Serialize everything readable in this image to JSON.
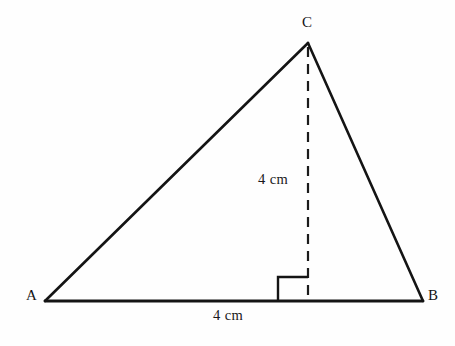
{
  "figure": {
    "kind": "geometry-triangle-with-altitude",
    "background_color": "#fefefe",
    "stroke_color": "#141414"
  },
  "vertices": {
    "a": {
      "label": "A",
      "x": 45,
      "y": 301
    },
    "b": {
      "label": "B",
      "x": 423,
      "y": 301
    },
    "c": {
      "label": "C",
      "x": 308,
      "y": 43
    }
  },
  "altitude": {
    "label": "4 cm",
    "style": "dashed",
    "from_x": 308,
    "from_y": 47,
    "to_x": 308,
    "to_y": 301,
    "dash_length": 10,
    "dash_gap": 7
  },
  "base": {
    "label": "4 cm",
    "from_x": 45,
    "from_y": 301,
    "to_x": 423,
    "to_y": 301
  },
  "right_angle_marker": {
    "name": "right-angle-square",
    "x": 278,
    "y": 277,
    "size_w": 30,
    "size_h": 24
  },
  "sides": {
    "ac": {
      "name": "side-ac"
    },
    "bc": {
      "name": "side-bc"
    },
    "ab": {
      "name": "side-ab"
    }
  }
}
